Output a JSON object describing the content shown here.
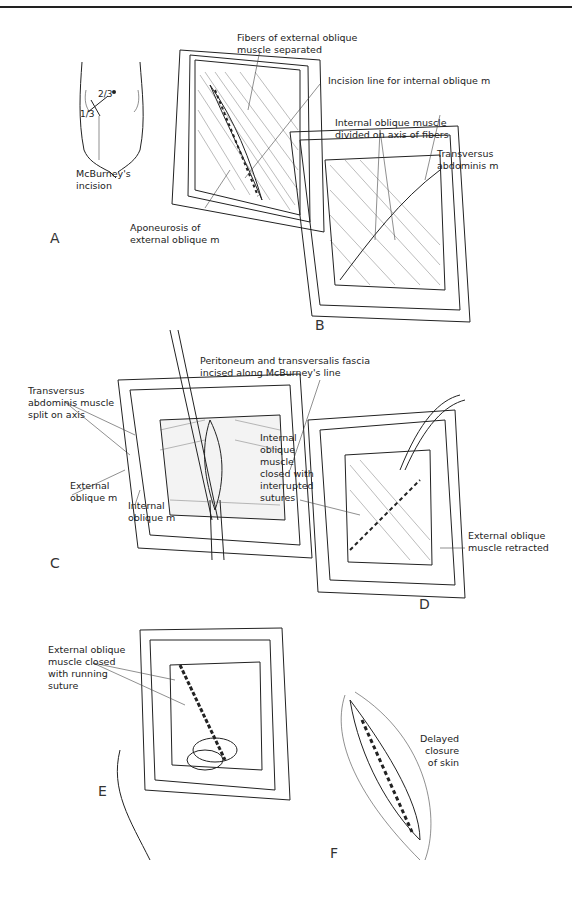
{
  "figure": {
    "panels": [
      {
        "id": "A",
        "label": "A",
        "annotations": [
          "McBurney's\nincision"
        ],
        "fractions": [
          "2/3",
          "1/3"
        ]
      },
      {
        "id": "B",
        "label": "B",
        "annotations": [
          "Fibers of external oblique\nmuscle separated",
          "Incision line for internal oblique m",
          "Aponeurosis of\nexternal oblique m",
          "Internal oblique muscle\ndivided on axis of fibers",
          "Transversus\nabdominis m"
        ]
      },
      {
        "id": "C",
        "label": "C",
        "annotations": [
          "Peritoneum and transversalis fascia\nincised along McBurney's line",
          "Transversus\nabdominis muscle\nsplit on axis",
          "External\noblique m",
          "Internal\noblique m"
        ]
      },
      {
        "id": "D",
        "label": "D",
        "annotations": [
          "Internal\noblique\nmuscle\nclosed with\ninterrupted\nsutures",
          "External oblique\nmuscle retracted"
        ]
      },
      {
        "id": "E",
        "label": "E",
        "annotations": [
          "External oblique\nmuscle closed\nwith running\nsuture"
        ]
      },
      {
        "id": "F",
        "label": "F",
        "annotations": [
          "Delayed\nclosure\nof skin"
        ]
      }
    ]
  },
  "labels": {
    "a_frac_two_thirds": "2/3",
    "a_frac_one_third": "1/3",
    "a_mcburney": "McBurney's\nincision",
    "a_panel": "A",
    "b_fibers": "Fibers of external oblique\nmuscle separated",
    "b_incision_line": "Incision line for internal oblique m",
    "b_aponeurosis": "Aponeurosis of\nexternal oblique m",
    "b_internal_divided": "Internal oblique muscle\ndivided on axis of fibers",
    "b_transversus": "Transversus\nabdominis m",
    "b_panel": "B",
    "c_peritoneum": "Peritoneum and transversalis fascia\nincised along McBurney's line",
    "c_transversus_split": "Transversus\nabdominis muscle\nsplit on axis",
    "c_external": "External\noblique m",
    "c_internal": "Internal\noblique m",
    "c_panel": "C",
    "d_internal_closed": "Internal\noblique\nmuscle\nclosed with\ninterrupted\nsutures",
    "d_external_retracted": "External oblique\nmuscle retracted",
    "d_panel": "D",
    "e_external_closed": "External oblique\nmuscle closed\nwith running\nsuture",
    "e_panel": "E",
    "f_delayed": "Delayed\nclosure\nof skin",
    "f_panel": "F"
  }
}
